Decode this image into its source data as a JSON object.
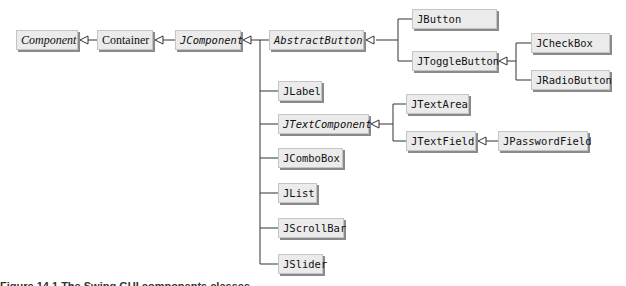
{
  "diagram": {
    "type": "uml-class-hierarchy",
    "nodes": {
      "component": "Component",
      "container": "Container",
      "jcomponent": "JComponent",
      "abstractbutton": "AbstractButton",
      "jbutton": "JButton",
      "jtogglebutton": "JToggleButton",
      "jcheckbox": "JCheckBox",
      "jradiobutton": "JRadioButton",
      "jlabel": "JLabel",
      "jtextcomponent": "JTextComponent",
      "jtextarea": "JTextArea",
      "jtextfield": "JTextField",
      "jpasswordfield": "JPasswordField",
      "jcombobox": "JComboBox",
      "jlist": "JList",
      "jscrollbar": "JScrollBar",
      "jslider": "JSlider"
    },
    "edges": [
      {
        "from": "Container",
        "to": "Component"
      },
      {
        "from": "JComponent",
        "to": "Container"
      },
      {
        "from": "AbstractButton",
        "to": "JComponent"
      },
      {
        "from": "JLabel",
        "to": "JComponent"
      },
      {
        "from": "JTextComponent",
        "to": "JComponent"
      },
      {
        "from": "JComboBox",
        "to": "JComponent"
      },
      {
        "from": "JList",
        "to": "JComponent"
      },
      {
        "from": "JScrollBar",
        "to": "JComponent"
      },
      {
        "from": "JSlider",
        "to": "JComponent"
      },
      {
        "from": "JButton",
        "to": "AbstractButton"
      },
      {
        "from": "JToggleButton",
        "to": "AbstractButton"
      },
      {
        "from": "JCheckBox",
        "to": "JToggleButton"
      },
      {
        "from": "JRadioButton",
        "to": "JToggleButton"
      },
      {
        "from": "JTextArea",
        "to": "JTextComponent"
      },
      {
        "from": "JTextField",
        "to": "JTextComponent"
      },
      {
        "from": "JPasswordField",
        "to": "JTextField"
      }
    ],
    "abstract_classes": [
      "Component",
      "JComponent",
      "AbstractButton",
      "JTextComponent"
    ],
    "colors": {
      "box_fill": "#ebebeb",
      "box_border": "#c4c4c4",
      "box_shadow": "#8a8a8a",
      "line": "#333333"
    }
  },
  "caption": {
    "text": "Figure 14.1   The Swing GUI components classes"
  }
}
